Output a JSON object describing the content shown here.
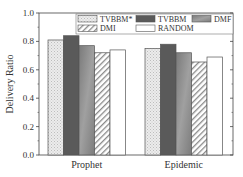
{
  "chart_data": {
    "type": "bar",
    "title": "",
    "xlabel": "",
    "ylabel": "Delivery Ratio",
    "ylim": [
      0.0,
      1.0
    ],
    "yticks": [
      "0.0",
      "0.2",
      "0.4",
      "0.6",
      "0.8",
      "1.0"
    ],
    "categories": [
      "Prophet",
      "Epidemic"
    ],
    "series": [
      {
        "name": "TVBBM*",
        "values": [
          0.81,
          0.75
        ],
        "fill": "light-crosshatch"
      },
      {
        "name": "TVBBM",
        "values": [
          0.84,
          0.78
        ],
        "fill": "#5a5a5a"
      },
      {
        "name": "DMF",
        "values": [
          0.77,
          0.72
        ],
        "fill": "gradient-gray"
      },
      {
        "name": "DMI",
        "values": [
          0.72,
          0.655
        ],
        "fill": "diagonal-hatch"
      },
      {
        "name": "RANDOM",
        "values": [
          0.74,
          0.69
        ],
        "fill": "#ffffff"
      }
    ],
    "legend_position": "top-inside",
    "grid": false
  }
}
